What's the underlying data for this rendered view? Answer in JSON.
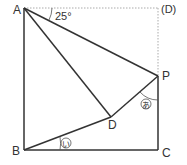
{
  "diagram": {
    "type": "geometry-square-fold",
    "points": {
      "A": {
        "label": "A",
        "x": 24,
        "y": 8
      },
      "D_orig": {
        "label": "(D)",
        "x": 158,
        "y": 8
      },
      "P": {
        "label": "P",
        "x": 158,
        "y": 76
      },
      "D": {
        "label": "D",
        "x": 111,
        "y": 117
      },
      "B": {
        "label": "B",
        "x": 24,
        "y": 150
      },
      "C": {
        "label": "C",
        "x": 158,
        "y": 150
      }
    },
    "angle_given": {
      "label": "25°",
      "vertex": "A"
    },
    "angle_marks": [
      {
        "label": "あ",
        "vertex": "P"
      },
      {
        "label": "い",
        "vertex": "B"
      }
    ],
    "colors": {
      "line": "#333333",
      "dotted": "#aaaaaa",
      "text": "#333333"
    }
  }
}
